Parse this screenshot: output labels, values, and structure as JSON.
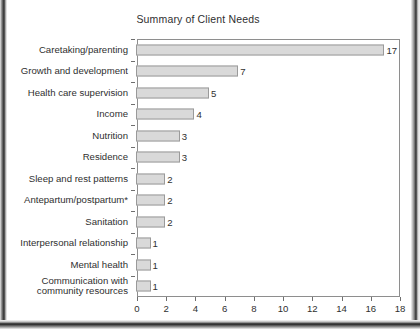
{
  "chart_data": {
    "type": "bar",
    "orientation": "horizontal",
    "title": "Summary of Client Needs",
    "xlabel": "",
    "ylabel": "",
    "xlim": [
      0,
      18
    ],
    "xticks": [
      0,
      2,
      4,
      6,
      8,
      10,
      12,
      14,
      16,
      18
    ],
    "grid": false,
    "legend": null,
    "bar_fill_color": "#d9d9d9",
    "bar_border_color": "#9a9a9a",
    "categories": [
      "Caretaking/parenting",
      "Growth and development",
      "Health care supervision",
      "Income",
      "Nutrition",
      "Residence",
      "Sleep and rest patterns",
      "Antepartum/postpartum*",
      "Sanitation",
      "Interpersonal relationship",
      "Mental health",
      "Communication with\ncommunity resources"
    ],
    "values": [
      17,
      7,
      5,
      4,
      3,
      3,
      2,
      2,
      2,
      1,
      1,
      1
    ],
    "data_labels": [
      "17",
      "7",
      "5",
      "4",
      "3",
      "3",
      "2",
      "2",
      "2",
      "1",
      "1",
      "1"
    ]
  }
}
